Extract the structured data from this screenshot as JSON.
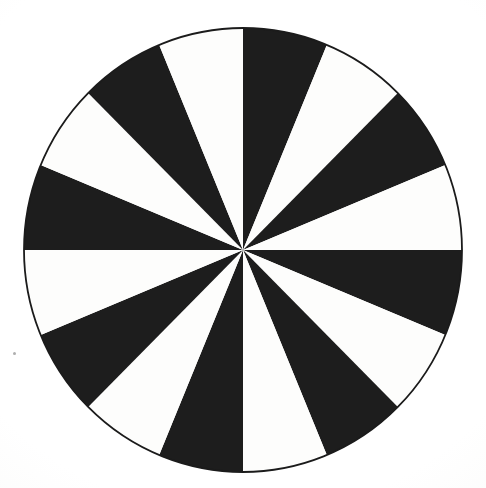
{
  "figure": {
    "title": "",
    "subtitle": "",
    "background_color": "#fdfdfc",
    "outline_color": "#1b1b1b",
    "fill_dark": "#1d1d1d",
    "fill_light": "#fdfdfc"
  },
  "geometry": {
    "center_x": 243,
    "center_y": 250,
    "radius_x": 219,
    "radius_y": 222,
    "outline_width": "1.8",
    "start_angle_deg": "0",
    "sector_count_label": "16",
    "sector_angle_label": "22.5"
  },
  "artifacts": {
    "speck_label": "scan-speck"
  },
  "chart_data": {
    "type": "pie",
    "title": "",
    "subtitle": "",
    "xlabel": "",
    "ylabel": "",
    "grid": false,
    "legend_position": "none",
    "total_sectors": 16,
    "sector_angle_degrees": 22.5,
    "start_angle_degrees": 0,
    "direction": "clockwise",
    "equal_slices": true,
    "categories": [
      "S1",
      "S2",
      "S3",
      "S4",
      "S5",
      "S6",
      "S7",
      "S8",
      "S9",
      "S10",
      "S11",
      "S12",
      "S13",
      "S14",
      "S15",
      "S16"
    ],
    "values": [
      6.25,
      6.25,
      6.25,
      6.25,
      6.25,
      6.25,
      6.25,
      6.25,
      6.25,
      6.25,
      6.25,
      6.25,
      6.25,
      6.25,
      6.25,
      6.25
    ],
    "value_unit": "percent",
    "colors": [
      "#1d1d1d",
      "#fdfdfc",
      "#1d1d1d",
      "#fdfdfc",
      "#1d1d1d",
      "#fdfdfc",
      "#1d1d1d",
      "#fdfdfc",
      "#1d1d1d",
      "#fdfdfc",
      "#1d1d1d",
      "#fdfdfc",
      "#1d1d1d",
      "#fdfdfc",
      "#1d1d1d",
      "#fdfdfc"
    ],
    "sectors": [
      {
        "index": 1,
        "start_deg": 0.0,
        "end_deg": 22.5,
        "fill": "black"
      },
      {
        "index": 2,
        "start_deg": 22.5,
        "end_deg": 45.0,
        "fill": "white"
      },
      {
        "index": 3,
        "start_deg": 45.0,
        "end_deg": 67.5,
        "fill": "black"
      },
      {
        "index": 4,
        "start_deg": 67.5,
        "end_deg": 90.0,
        "fill": "white"
      },
      {
        "index": 5,
        "start_deg": 90.0,
        "end_deg": 112.5,
        "fill": "black"
      },
      {
        "index": 6,
        "start_deg": 112.5,
        "end_deg": 135.0,
        "fill": "white"
      },
      {
        "index": 7,
        "start_deg": 135.0,
        "end_deg": 157.5,
        "fill": "black"
      },
      {
        "index": 8,
        "start_deg": 157.5,
        "end_deg": 180.0,
        "fill": "white"
      },
      {
        "index": 9,
        "start_deg": 180.0,
        "end_deg": 202.5,
        "fill": "black"
      },
      {
        "index": 10,
        "start_deg": 202.5,
        "end_deg": 225.0,
        "fill": "white"
      },
      {
        "index": 11,
        "start_deg": 225.0,
        "end_deg": 247.5,
        "fill": "black"
      },
      {
        "index": 12,
        "start_deg": 247.5,
        "end_deg": 270.0,
        "fill": "white"
      },
      {
        "index": 13,
        "start_deg": 270.0,
        "end_deg": 292.5,
        "fill": "black"
      },
      {
        "index": 14,
        "start_deg": 292.5,
        "end_deg": 315.0,
        "fill": "white"
      },
      {
        "index": 15,
        "start_deg": 315.0,
        "end_deg": 337.5,
        "fill": "black"
      },
      {
        "index": 16,
        "start_deg": 337.5,
        "end_deg": 360.0,
        "fill": "white"
      }
    ],
    "annotations": []
  }
}
